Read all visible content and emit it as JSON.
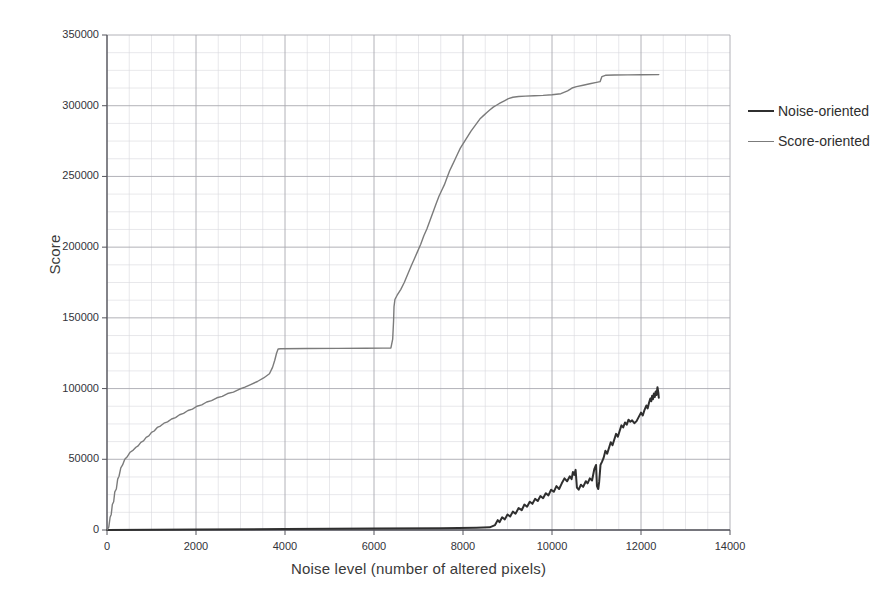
{
  "figure": {
    "ghost_header_text": "",
    "plot": {
      "left": 107,
      "top": 35,
      "width": 623,
      "height": 495
    }
  },
  "axes": {
    "y_title": "Score",
    "x_title": "Noise level (number of altered pixels)",
    "y_ticks": [
      "0",
      "50000",
      "100000",
      "150000",
      "200000",
      "250000",
      "300000",
      "350000"
    ],
    "x_ticks": [
      "0",
      "2000",
      "4000",
      "6000",
      "8000",
      "10000",
      "12000",
      "14000"
    ]
  },
  "legend": {
    "items": [
      {
        "label": "Noise-oriented",
        "color": "#2f2f2f",
        "width": 2.0
      },
      {
        "label": "Score-oriented",
        "color": "#7b7b7b",
        "width": 1.4
      }
    ]
  },
  "chart_data": {
    "type": "line",
    "title": "",
    "xlabel": "Noise level (number of altered pixels)",
    "ylabel": "Score",
    "xlim": [
      0,
      14000
    ],
    "ylim": [
      0,
      350000
    ],
    "x_major_step": 2000,
    "y_major_step": 50000,
    "x_minor_step": 500,
    "y_minor_step": 12500,
    "grid": true,
    "legend_position": "right",
    "series": [
      {
        "name": "Score-oriented",
        "color": "#7b7b7b",
        "points": [
          [
            0,
            0
          ],
          [
            40,
            2000
          ],
          [
            70,
            9000
          ],
          [
            95,
            11000
          ],
          [
            120,
            18000
          ],
          [
            150,
            20000
          ],
          [
            175,
            27000
          ],
          [
            210,
            29000
          ],
          [
            240,
            36000
          ],
          [
            270,
            38000
          ],
          [
            310,
            44000
          ],
          [
            350,
            46000
          ],
          [
            400,
            50000
          ],
          [
            460,
            52000
          ],
          [
            520,
            55000
          ],
          [
            590,
            56500
          ],
          [
            650,
            58500
          ],
          [
            700,
            59500
          ],
          [
            760,
            62000
          ],
          [
            820,
            63000
          ],
          [
            880,
            65500
          ],
          [
            940,
            66500
          ],
          [
            1000,
            69000
          ],
          [
            1060,
            70000
          ],
          [
            1130,
            72500
          ],
          [
            1200,
            73500
          ],
          [
            1280,
            75500
          ],
          [
            1360,
            76500
          ],
          [
            1450,
            78500
          ],
          [
            1540,
            79500
          ],
          [
            1630,
            81500
          ],
          [
            1720,
            82500
          ],
          [
            1820,
            84500
          ],
          [
            1920,
            85500
          ],
          [
            2020,
            87500
          ],
          [
            2130,
            88500
          ],
          [
            2240,
            90500
          ],
          [
            2350,
            91500
          ],
          [
            2470,
            93500
          ],
          [
            2590,
            94500
          ],
          [
            2710,
            96500
          ],
          [
            2840,
            97500
          ],
          [
            2970,
            99500
          ],
          [
            3100,
            101000
          ],
          [
            3240,
            103000
          ],
          [
            3380,
            105000
          ],
          [
            3520,
            107500
          ],
          [
            3650,
            110500
          ],
          [
            3720,
            115000
          ],
          [
            3770,
            120000
          ],
          [
            3810,
            125000
          ],
          [
            3845,
            128000
          ],
          [
            3900,
            128200
          ],
          [
            4500,
            128300
          ],
          [
            5200,
            128400
          ],
          [
            5800,
            128500
          ],
          [
            6200,
            128600
          ],
          [
            6380,
            128700
          ],
          [
            6420,
            135000
          ],
          [
            6440,
            148000
          ],
          [
            6450,
            158000
          ],
          [
            6470,
            163000
          ],
          [
            6520,
            166000
          ],
          [
            6600,
            170000
          ],
          [
            6680,
            175000
          ],
          [
            6760,
            181000
          ],
          [
            6840,
            187000
          ],
          [
            6910,
            192000
          ],
          [
            6980,
            197000
          ],
          [
            7050,
            202000
          ],
          [
            7120,
            208000
          ],
          [
            7190,
            213000
          ],
          [
            7260,
            219000
          ],
          [
            7330,
            225000
          ],
          [
            7400,
            231000
          ],
          [
            7460,
            236000
          ],
          [
            7520,
            240000
          ],
          [
            7580,
            244000
          ],
          [
            7640,
            249000
          ],
          [
            7700,
            254000
          ],
          [
            7760,
            258000
          ],
          [
            7820,
            262000
          ],
          [
            7880,
            266000
          ],
          [
            7940,
            270000
          ],
          [
            8000,
            273000
          ],
          [
            8060,
            276000
          ],
          [
            8120,
            279000
          ],
          [
            8180,
            282000
          ],
          [
            8250,
            285000
          ],
          [
            8320,
            288000
          ],
          [
            8390,
            291000
          ],
          [
            8460,
            293000
          ],
          [
            8530,
            295000
          ],
          [
            8600,
            297000
          ],
          [
            8680,
            299000
          ],
          [
            8760,
            300500
          ],
          [
            8840,
            302000
          ],
          [
            8930,
            303500
          ],
          [
            9020,
            305000
          ],
          [
            9120,
            306000
          ],
          [
            9250,
            306500
          ],
          [
            9400,
            306800
          ],
          [
            9600,
            307000
          ],
          [
            9800,
            307300
          ],
          [
            10000,
            307800
          ],
          [
            10200,
            308500
          ],
          [
            10350,
            310500
          ],
          [
            10450,
            312500
          ],
          [
            10550,
            313500
          ],
          [
            10700,
            314500
          ],
          [
            10850,
            315500
          ],
          [
            11000,
            316500
          ],
          [
            11080,
            317000
          ],
          [
            11120,
            320500
          ],
          [
            11200,
            321500
          ],
          [
            11400,
            321700
          ],
          [
            11700,
            321800
          ],
          [
            12000,
            321900
          ],
          [
            12400,
            322000
          ]
        ]
      },
      {
        "name": "Noise-oriented",
        "color": "#2f2f2f",
        "points": [
          [
            0,
            0
          ],
          [
            2000,
            400
          ],
          [
            4000,
            700
          ],
          [
            6000,
            1000
          ],
          [
            7500,
            1300
          ],
          [
            8300,
            1600
          ],
          [
            8600,
            1900
          ],
          [
            8720,
            3500
          ],
          [
            8780,
            7000
          ],
          [
            8820,
            5500
          ],
          [
            8880,
            9000
          ],
          [
            8940,
            7500
          ],
          [
            9000,
            11000
          ],
          [
            9060,
            9500
          ],
          [
            9120,
            13000
          ],
          [
            9180,
            11500
          ],
          [
            9250,
            15500
          ],
          [
            9320,
            14000
          ],
          [
            9380,
            18000
          ],
          [
            9440,
            16500
          ],
          [
            9500,
            20000
          ],
          [
            9560,
            18500
          ],
          [
            9620,
            22000
          ],
          [
            9680,
            20500
          ],
          [
            9740,
            24000
          ],
          [
            9800,
            22500
          ],
          [
            9860,
            26000
          ],
          [
            9920,
            24500
          ],
          [
            9980,
            28500
          ],
          [
            10040,
            27000
          ],
          [
            10100,
            31000
          ],
          [
            10160,
            29000
          ],
          [
            10220,
            33000
          ],
          [
            10280,
            36500
          ],
          [
            10340,
            34500
          ],
          [
            10400,
            38000
          ],
          [
            10440,
            36000
          ],
          [
            10470,
            41000
          ],
          [
            10500,
            39000
          ],
          [
            10530,
            42500
          ],
          [
            10560,
            30000
          ],
          [
            10600,
            28500
          ],
          [
            10650,
            32000
          ],
          [
            10700,
            30500
          ],
          [
            10760,
            34500
          ],
          [
            10800,
            33000
          ],
          [
            10850,
            36500
          ],
          [
            10900,
            35000
          ],
          [
            10950,
            43000
          ],
          [
            10990,
            46000
          ],
          [
            11010,
            31000
          ],
          [
            11040,
            29000
          ],
          [
            11060,
            34000
          ],
          [
            11090,
            46000
          ],
          [
            11120,
            48000
          ],
          [
            11160,
            51000
          ],
          [
            11200,
            56000
          ],
          [
            11240,
            54000
          ],
          [
            11280,
            58000
          ],
          [
            11320,
            62000
          ],
          [
            11360,
            60000
          ],
          [
            11400,
            64000
          ],
          [
            11440,
            68000
          ],
          [
            11480,
            66000
          ],
          [
            11520,
            70000
          ],
          [
            11560,
            74000
          ],
          [
            11600,
            72500
          ],
          [
            11640,
            76000
          ],
          [
            11680,
            74500
          ],
          [
            11720,
            78000
          ],
          [
            11760,
            76500
          ],
          [
            11800,
            77500
          ],
          [
            11850,
            75500
          ],
          [
            11900,
            77000
          ],
          [
            11950,
            80000
          ],
          [
            12000,
            83000
          ],
          [
            12040,
            81000
          ],
          [
            12080,
            85000
          ],
          [
            12120,
            88000
          ],
          [
            12150,
            86000
          ],
          [
            12180,
            90000
          ],
          [
            12210,
            93000
          ],
          [
            12230,
            91000
          ],
          [
            12250,
            95000
          ],
          [
            12270,
            92500
          ],
          [
            12290,
            96500
          ],
          [
            12310,
            94000
          ],
          [
            12330,
            98000
          ],
          [
            12350,
            95500
          ],
          [
            12370,
            101000
          ],
          [
            12390,
            97000
          ],
          [
            12400,
            93500
          ]
        ]
      }
    ]
  }
}
